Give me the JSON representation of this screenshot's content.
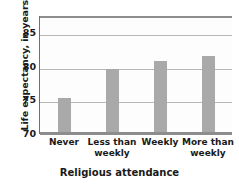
{
  "chart_data": {
    "type": "bar",
    "title": "",
    "xlabel": "Religious attendance",
    "ylabel": "Life expectancy, in years",
    "categories": [
      "Never",
      "Less than weekly",
      "Weekly",
      "More than weekly"
    ],
    "values": [
      75.3,
      79.7,
      80.9,
      81.5
    ],
    "ylim": [
      70,
      87.5
    ],
    "yticks": [
      70,
      75,
      80,
      85
    ],
    "ytick_labels": [
      "70",
      "75",
      "80",
      "85"
    ],
    "grid": true,
    "legend": "none",
    "bar_color": "#a9a9a9",
    "axis_color": "#8d8d8d",
    "gridline_color": "#b6b6b6",
    "background_color": "#ffffff"
  },
  "axes": {
    "y_title": "Life expectancy, in years",
    "x_title": "Religious attendance"
  },
  "x_labels": [
    {
      "line1": "Never",
      "line2": ""
    },
    {
      "line1": "Less than",
      "line2": "weekly"
    },
    {
      "line1": "Weekly",
      "line2": ""
    },
    {
      "line1": "More than",
      "line2": "weekly"
    }
  ]
}
